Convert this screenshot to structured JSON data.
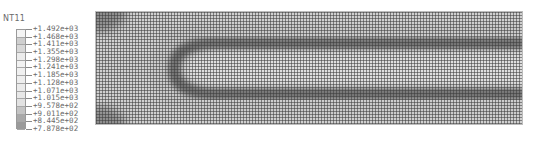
{
  "legend": {
    "title": "NT11",
    "values": [
      "+1.492e+03",
      "+1.468e+03",
      "+1.411e+03",
      "+1.355e+03",
      "+1.298e+03",
      "+1.241e+03",
      "+1.185e+03",
      "+1.128e+03",
      "+1.071e+03",
      "+1.015e+03",
      "+9.578e+02",
      "+9.011e+02",
      "+8.445e+02",
      "+7.878e+02"
    ],
    "swatch_colors": [
      "#f4f4f4",
      "#cfcfcf",
      "#d8d8d8",
      "#ececec",
      "#f2f2f2",
      "#f0f0f0",
      "#eeeeee",
      "#ebebeb",
      "#e8e8e8",
      "#e2e2e2",
      "#c4c4c4",
      "#a9a9a9",
      "#9a9a9a"
    ]
  },
  "viewport": {
    "model": "mesh-contour-plot",
    "variable": "NT11"
  }
}
